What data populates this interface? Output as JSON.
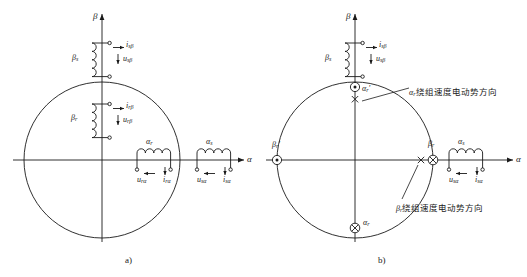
{
  "figure": {
    "title_absent": true,
    "panels": [
      {
        "id": "a",
        "caption": "a)",
        "axes": {
          "x_label": "α",
          "y_label": "β"
        },
        "coils": [
          {
            "name": "stator-beta-coil",
            "winding_label": "β",
            "winding_sub": "s",
            "current_label": "i",
            "current_sub": "sβ",
            "voltage_label": "u",
            "voltage_sub": "sβ"
          },
          {
            "name": "rotor-beta-coil",
            "winding_label": "β",
            "winding_sub": "r",
            "current_label": "i",
            "current_sub": "rβ",
            "voltage_label": "u",
            "voltage_sub": "rβ"
          },
          {
            "name": "rotor-alpha-coil",
            "winding_label": "α",
            "winding_sub": "r",
            "current_label": "i",
            "current_sub": "rα",
            "voltage_label": "u",
            "voltage_sub": "rα"
          },
          {
            "name": "stator-alpha-coil",
            "winding_label": "α",
            "winding_sub": "s",
            "current_label": "i",
            "current_sub": "sα",
            "voltage_label": "u",
            "voltage_sub": "sα"
          }
        ]
      },
      {
        "id": "b",
        "caption": "b)",
        "axes": {
          "x_label": "α",
          "y_label": "β"
        },
        "coils": [
          {
            "name": "stator-beta-coil",
            "winding_label": "β",
            "winding_sub": "s",
            "current_label": "i",
            "current_sub": "sβ",
            "voltage_label": "u",
            "voltage_sub": "sβ"
          },
          {
            "name": "stator-alpha-coil",
            "winding_label": "α",
            "winding_sub": "s",
            "current_label": "i",
            "current_sub": "sα",
            "voltage_label": "u",
            "voltage_sub": "sα"
          }
        ],
        "markers": [
          {
            "name": "marker-alpha-r-prime",
            "label": "α",
            "sub": "r",
            "prime": "′",
            "glyph": "dot-in-circle"
          },
          {
            "name": "marker-alpha-r-top-cross",
            "label": "",
            "sub": "",
            "prime": "",
            "glyph": "cross"
          },
          {
            "name": "marker-beta-r-prime",
            "label": "β",
            "sub": "r",
            "prime": "′",
            "glyph": "dot-in-circle"
          },
          {
            "name": "marker-beta-r-cross",
            "label": "",
            "sub": "",
            "prime": "",
            "glyph": "cross"
          },
          {
            "name": "marker-beta-r",
            "label": "β",
            "sub": "r",
            "prime": "",
            "glyph": "cross-in-circle"
          },
          {
            "name": "marker-alpha-r",
            "label": "α",
            "sub": "r",
            "prime": "",
            "glyph": "cross-in-circle"
          }
        ],
        "annotations": [
          {
            "name": "annotation-alpha-r-emf-direction",
            "symbol": "α",
            "symbol_sub": "r",
            "text": "绕组速度电动势方向"
          },
          {
            "name": "annotation-beta-r-emf-direction",
            "symbol": "β",
            "symbol_sub": "r",
            "text": "绕组速度电动势方向"
          }
        ]
      }
    ]
  },
  "style": {
    "line_color": "#1a1a1a",
    "bg": "#ffffff"
  }
}
